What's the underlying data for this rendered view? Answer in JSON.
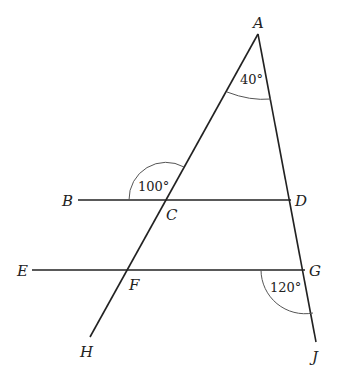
{
  "diagram": {
    "type": "geometry",
    "points": {
      "A": {
        "label": "A",
        "x": 258,
        "y": 34
      },
      "B": {
        "label": "B",
        "x": 78,
        "y": 200
      },
      "C": {
        "label": "C",
        "x": 166,
        "y": 200
      },
      "D": {
        "label": "D",
        "x": 290,
        "y": 200
      },
      "E": {
        "label": "E",
        "x": 32,
        "y": 270
      },
      "F": {
        "label": "F",
        "x": 127,
        "y": 270
      },
      "G": {
        "label": "G",
        "x": 305,
        "y": 270
      },
      "H": {
        "label": "H",
        "x": 90,
        "y": 337
      },
      "J": {
        "label": "J",
        "x": 316,
        "y": 342
      }
    },
    "segments": [
      "A-H",
      "A-J",
      "B-D",
      "E-G"
    ],
    "angles": [
      {
        "vertex": "A",
        "value": "40°"
      },
      {
        "vertex": "C",
        "value": "100°"
      },
      {
        "vertex": "G",
        "value": "120°"
      }
    ]
  }
}
